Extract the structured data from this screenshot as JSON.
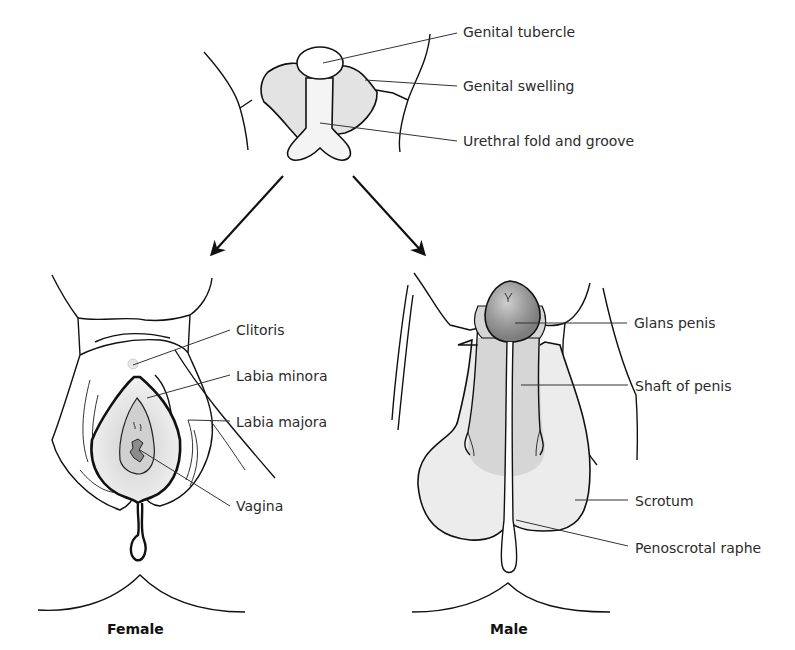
{
  "figure": {
    "top": {
      "labels": [
        {
          "id": "genital-tubercle",
          "text": "Genital tubercle"
        },
        {
          "id": "genital-swelling",
          "text": "Genital swelling"
        },
        {
          "id": "urethral-fold-and-groove",
          "text": "Urethral fold and groove"
        }
      ]
    },
    "female": {
      "caption": "Female",
      "labels": [
        {
          "id": "clitoris",
          "text": "Clitoris"
        },
        {
          "id": "labia-minora",
          "text": "Labia minora"
        },
        {
          "id": "labia-majora",
          "text": "Labia majora"
        },
        {
          "id": "vagina",
          "text": "Vagina"
        }
      ]
    },
    "male": {
      "caption": "Male",
      "labels": [
        {
          "id": "glans-penis",
          "text": "Glans penis"
        },
        {
          "id": "shaft-of-penis",
          "text": "Shaft of penis"
        },
        {
          "id": "scrotum",
          "text": "Scrotum"
        },
        {
          "id": "penoscrotal-raphe",
          "text": "Penoscrotal raphe"
        }
      ]
    },
    "colors": {
      "swelling_fill": "#e3e3e3",
      "light_fill": "#ececec",
      "shaft_fill": "#d6d6d6",
      "glans_fill": "#9a9a9a",
      "vagina_fill": "#8c8c8c",
      "outline": "#111111",
      "label_text": "#2b2b2b"
    }
  }
}
